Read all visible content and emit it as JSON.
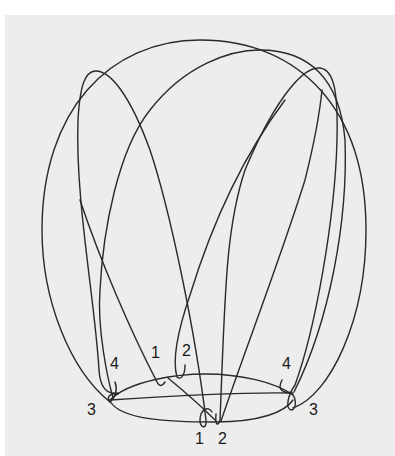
{
  "diagram": {
    "background_color": "#ededed",
    "stroke_color": "#2a2a2a",
    "labels": {
      "top_1": "1",
      "top_2": "2",
      "left_4": "4",
      "right_4": "4",
      "left_3": "3",
      "right_3": "3",
      "bottom_1": "1",
      "bottom_2": "2"
    }
  }
}
